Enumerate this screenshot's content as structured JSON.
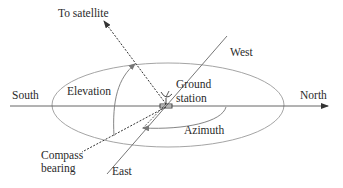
{
  "diagram": {
    "labels": {
      "to_satellite": "To satellite",
      "west": "West",
      "south": "South",
      "north": "North",
      "east": "East",
      "elevation": "Elevation",
      "ground": "Ground",
      "station": "station",
      "azimuth": "Azimuth",
      "compass": "Compass",
      "bearing": "bearing"
    },
    "colors": {
      "line": "#555555",
      "arc": "#8a8a8a",
      "text": "#2a2a2a"
    }
  }
}
